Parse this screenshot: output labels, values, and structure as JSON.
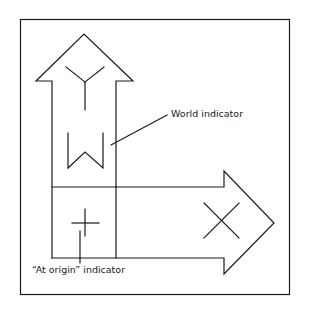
{
  "diagram": {
    "labels": {
      "world_indicator": "World indicator",
      "at_origin_indicator": "“At origin” indicator"
    },
    "axes": [
      {
        "name": "Y",
        "direction": "up"
      },
      {
        "name": "X",
        "direction": "right"
      }
    ],
    "glyphs": [
      "Y",
      "W",
      "X",
      "+"
    ],
    "colors": {
      "stroke": "#1a1a1a",
      "background": "#ffffff"
    }
  }
}
